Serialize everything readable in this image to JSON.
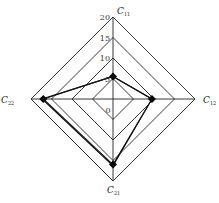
{
  "chart_data": {
    "type": "radar",
    "title": "",
    "axes": [
      {
        "key": "C11",
        "label": "C",
        "sub": "11"
      },
      {
        "key": "C12",
        "label": "C",
        "sub": "12"
      },
      {
        "key": "C21",
        "label": "C",
        "sub": "21"
      },
      {
        "key": "C22",
        "label": "C",
        "sub": "22"
      }
    ],
    "range": [
      0,
      20
    ],
    "ticks": [
      0,
      5,
      10,
      15,
      20
    ],
    "tick_labels": [
      "0",
      "5",
      "10",
      "15",
      "20"
    ],
    "series": [
      {
        "name": "series-1",
        "values": [
          5.5,
          9.5,
          16,
          17
        ],
        "markers": true
      },
      {
        "name": "series-2",
        "values": [
          5.5,
          9.5,
          16.3,
          17.3
        ],
        "markers": false
      }
    ],
    "grid": true,
    "legend": "none"
  }
}
